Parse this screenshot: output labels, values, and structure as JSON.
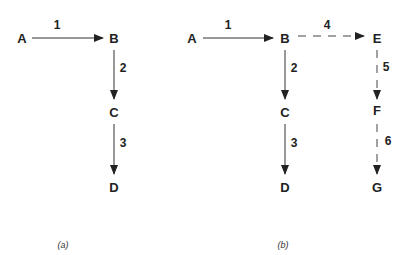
{
  "panels": [
    {
      "caption": "(a)",
      "nodes": {
        "A": "A",
        "B": "B",
        "C": "C",
        "D": "D"
      },
      "edges": [
        {
          "from": "A",
          "to": "B",
          "label": "1",
          "style": "solid"
        },
        {
          "from": "B",
          "to": "C",
          "label": "2",
          "style": "solid"
        },
        {
          "from": "C",
          "to": "D",
          "label": "3",
          "style": "solid"
        }
      ]
    },
    {
      "caption": "(b)",
      "nodes": {
        "A": "A",
        "B": "B",
        "C": "C",
        "D": "D",
        "E": "E",
        "F": "F",
        "G": "G"
      },
      "edges": [
        {
          "from": "A",
          "to": "B",
          "label": "1",
          "style": "solid"
        },
        {
          "from": "B",
          "to": "C",
          "label": "2",
          "style": "solid"
        },
        {
          "from": "C",
          "to": "D",
          "label": "3",
          "style": "solid"
        },
        {
          "from": "B",
          "to": "E",
          "label": "4",
          "style": "dashed"
        },
        {
          "from": "E",
          "to": "F",
          "label": "5",
          "style": "dashed"
        },
        {
          "from": "F",
          "to": "G",
          "label": "6",
          "style": "dashed"
        }
      ]
    }
  ]
}
